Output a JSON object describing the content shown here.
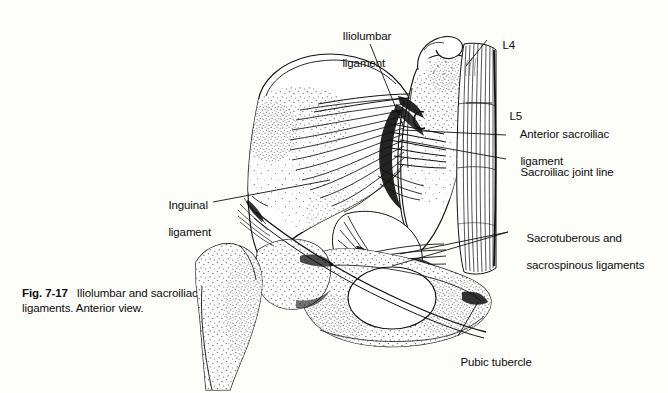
{
  "figure": {
    "caption_number": "Fig. 7-17",
    "caption_line1": "Iliolumbar and sacroiliac",
    "caption_line2": "ligaments. Anterior view.",
    "view": "Anterior view",
    "subject": "Iliolumbar and sacroiliac ligaments",
    "style": "black-and-white line drawing with stipple shading",
    "background_color": "#fdfdfa",
    "ink_color": "#111111"
  },
  "labels": {
    "iliolumbar": {
      "line1": "Iliolumbar",
      "line2": "ligament"
    },
    "l4": {
      "text": "L4"
    },
    "l5": {
      "text": "L5"
    },
    "anterior_sacroiliac": {
      "line1": "Anterior sacroiliac",
      "line2": "ligament"
    },
    "sacroiliac_joint_line": {
      "text": "Sacroiliac joint line"
    },
    "sacrotuberous": {
      "line1": "Sacrotuberous and",
      "line2": "sacrospinous ligaments"
    },
    "inguinal": {
      "line1": "Inguinal",
      "line2": "ligament"
    },
    "pubic_tubercle": {
      "text": "Pubic tubercle"
    }
  },
  "anatomy_parts": [
    "ilium",
    "iliac crest",
    "anterior superior iliac spine",
    "sacrum",
    "L4 vertebral body",
    "L5 vertebral body",
    "anterior longitudinal ligament",
    "sacroiliac joint",
    "acetabulum",
    "femoral head",
    "greater trochanter",
    "femoral neck",
    "obturator foramen",
    "pubis",
    "ischium",
    "pubic tubercle"
  ]
}
